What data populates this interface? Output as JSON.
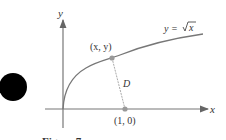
{
  "figure": {
    "caption": "Figure 7",
    "curve_label_prefix": "y = ",
    "curve_label_radicand": "x",
    "point_label": "(x, y)",
    "fixed_point_label": "(1, 0)",
    "distance_label": "D",
    "x_axis_label": "x",
    "y_axis_label": "y",
    "colors": {
      "curve": "#777777",
      "axes": "#777777",
      "points": "#9a9a9a",
      "segment": "#aaaaaa",
      "dot": "#000000"
    }
  }
}
